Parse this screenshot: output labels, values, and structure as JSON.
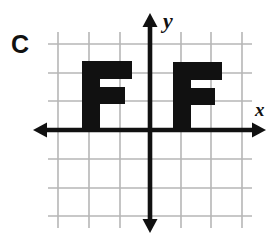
{
  "figure": {
    "label": "C",
    "background_color": "#ffffff",
    "ink_color": "#111111",
    "grid_color": "#b6b6b6"
  },
  "axes": {
    "x_axis_label": "x",
    "y_axis_label": "y",
    "origin": {
      "x": 150,
      "y": 130
    },
    "cell_size": 30,
    "x_axis": {
      "y": 130,
      "x_start": 33,
      "x_end": 266,
      "arrows": "both"
    },
    "y_axis": {
      "x": 150,
      "y_start": 13,
      "y_end": 233,
      "arrows": "both"
    }
  },
  "grid": {
    "vertical_lines": [
      58,
      89,
      120,
      150,
      181,
      211,
      242
    ],
    "horizontal_lines": [
      44,
      73,
      101,
      130,
      159,
      188,
      216
    ],
    "left": 48,
    "right": 252,
    "top": 32,
    "bottom": 228
  },
  "shapes": [
    {
      "name": "letter-f-left",
      "text": "F",
      "quadrant": "second",
      "stem": {
        "x": 82,
        "y": 61,
        "w": 18,
        "h": 69
      },
      "top_arm": {
        "x": 82,
        "y": 61,
        "w": 50,
        "h": 18
      },
      "mid_arm": {
        "x": 82,
        "y": 87,
        "w": 43,
        "h": 17
      }
    },
    {
      "name": "letter-f-right",
      "text": "F",
      "quadrant": "first",
      "stem": {
        "x": 173,
        "y": 62,
        "w": 18,
        "h": 68
      },
      "top_arm": {
        "x": 173,
        "y": 62,
        "w": 49,
        "h": 18
      },
      "mid_arm": {
        "x": 173,
        "y": 88,
        "w": 42,
        "h": 17
      }
    }
  ]
}
